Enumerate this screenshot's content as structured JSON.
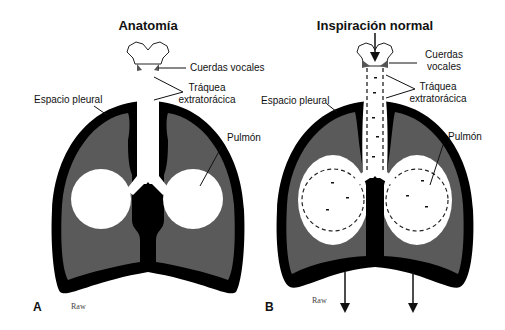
{
  "panels": [
    {
      "letter": "A",
      "title": "Anatomía",
      "labels": {
        "vocal_cords": "Cuerdas vocales",
        "trachea_line1": "Tráquea",
        "trachea_line2": "extratorácica",
        "pleural_space": "Espacio pleural",
        "lung": "Pulmón",
        "raw": "Raw"
      }
    },
    {
      "letter": "B",
      "title": "Inspiración normal",
      "labels": {
        "vocal_cords_line1": "Cuerdas",
        "vocal_cords_line2": "vocales",
        "trachea_line1": "Tráquea",
        "trachea_line2": "extratorácica",
        "pleural_space": "Espacio pleural",
        "lung": "Pulmón",
        "raw": "Raw"
      }
    }
  ],
  "colors": {
    "pleura": "#000000",
    "lung": "#5a5a5a",
    "airway": "#ffffff"
  }
}
